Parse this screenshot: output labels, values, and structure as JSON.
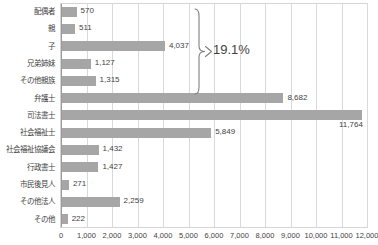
{
  "chart_data": {
    "type": "bar",
    "orientation": "horizontal",
    "title": "",
    "xlabel": "",
    "ylabel": "",
    "xlim": [
      0,
      12000
    ],
    "xtick_step": 1000,
    "grid": true,
    "legend": false,
    "bar_color": "#a6a6a6",
    "categories": [
      "配偶者",
      "親",
      "子",
      "兄弟姉妹",
      "その他親族",
      "弁護士",
      "司法書士",
      "社会福祉士",
      "社会福祉協議会",
      "行政書士",
      "市民後見人",
      "その他法人",
      "その他"
    ],
    "values": [
      570,
      511,
      4037,
      1127,
      1315,
      8682,
      11764,
      5849,
      1432,
      1427,
      271,
      2259,
      222
    ],
    "value_labels": [
      "570",
      "511",
      "4,037",
      "1,127",
      "1,315",
      "8,682",
      "11,764",
      "5,849",
      "1,432",
      "1,427",
      "271",
      "2,259",
      "222"
    ],
    "xtick_labels": [
      "0",
      "1,000",
      "2,000",
      "3,000",
      "4,000",
      "5,000",
      "6,000",
      "7,000",
      "8,000",
      "9,000",
      "10,000",
      "11,000",
      "12,000"
    ],
    "annotations": [
      {
        "text": "19.1%",
        "type": "brace",
        "covers_categories": [
          "配偶者",
          "親",
          "子",
          "兄弟姉妹",
          "その他親族"
        ]
      }
    ]
  }
}
